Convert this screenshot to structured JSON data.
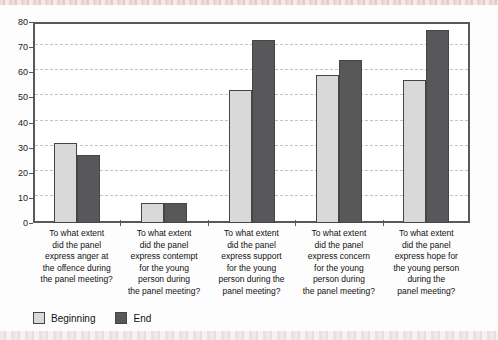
{
  "chart_data": {
    "type": "bar",
    "title": "",
    "xlabel": "",
    "ylabel": "",
    "ylim": [
      0,
      80
    ],
    "ytick_step": 10,
    "grid": "horizontal-dashed",
    "legend_position": "bottom-left",
    "categories": [
      "To what extent\ndid the panel\nexpress anger at\nthe offence during\nthe panel meeting?",
      "To what extent\ndid the panel\nexpress contempt\nfor the young\nperson during\nthe panel meeting?",
      "To what extent\ndid the panel\nexpress support\nfor the young\nperson during the\npanel meeting?",
      "To what extent\ndid the panel\nexpress concern\nfor the young\nperson during\nthe panel meeting?",
      "To what extent\ndid the panel\nexpress hope for\nthe young person\nduring the\npanel meeting?"
    ],
    "series": [
      {
        "name": "Beginning",
        "color": "#d9d9d9",
        "values": [
          32,
          8,
          53,
          59,
          57
        ]
      },
      {
        "name": "End",
        "color": "#58585a",
        "values": [
          27,
          8,
          73,
          65,
          77
        ]
      }
    ]
  },
  "colors": {
    "plot_border": "#59595c",
    "gridline": "#c3c3c3",
    "bar_outline": "#454545",
    "band_pink": "#e7c6c6",
    "text": "#111111"
  }
}
